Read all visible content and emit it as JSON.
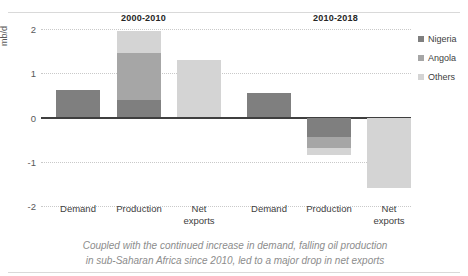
{
  "chart_data": {
    "type": "bar",
    "title": "",
    "xlabel": "",
    "ylabel": "mb/d",
    "ylim": [
      -2,
      2
    ],
    "yticks": [
      "2",
      "1",
      "0",
      "-1",
      "-2"
    ],
    "grid": true,
    "legend_position": "right",
    "stacked": true,
    "groups": [
      {
        "label": "2000-2010",
        "categories": [
          "Demand",
          "Net\nexports"
        ],
        "bars": [
          {
            "category": "Demand",
            "total": 0.62,
            "segments": [
              {
                "name": "Nigeria",
                "value": 0.62
              }
            ]
          },
          {
            "category": "Production",
            "total": 1.95,
            "segments": [
              {
                "name": "Nigeria",
                "value": 0.4
              },
              {
                "name": "Angola",
                "value": 1.05
              },
              {
                "name": "Others",
                "value": 0.5
              }
            ]
          },
          {
            "category": "Net exports",
            "total": 1.3,
            "segments": [
              {
                "name": "Others",
                "value": 1.3
              }
            ]
          }
        ]
      },
      {
        "label": "2010-2018",
        "categories": [
          "Demand",
          "Production",
          "Net exports"
        ],
        "bars": [
          {
            "category": "Demand",
            "total": 0.56,
            "segments": [
              {
                "name": "Nigeria",
                "value": 0.56
              }
            ]
          },
          {
            "category": "Production",
            "total": -0.85,
            "segments": [
              {
                "name": "Nigeria",
                "value": -0.45
              },
              {
                "name": "Angola",
                "value": -0.25
              },
              {
                "name": "Others",
                "value": -0.15
              }
            ]
          },
          {
            "category": "Net exports",
            "total": -1.6,
            "segments": [
              {
                "name": "Others",
                "value": -1.6
              }
            ]
          }
        ]
      }
    ],
    "legend": [
      {
        "label": "Nigeria",
        "color": "#7f7f7f"
      },
      {
        "label": "Angola",
        "color": "#a6a6a6"
      },
      {
        "label": "Others",
        "color": "#d4d4d4"
      }
    ]
  },
  "xlabels": [
    {
      "line1": "Demand",
      "line2": ""
    },
    {
      "line1": "Production",
      "line2": ""
    },
    {
      "line1": "Net",
      "line2": "exports"
    },
    {
      "line1": "Demand",
      "line2": ""
    },
    {
      "line1": "Production",
      "line2": ""
    },
    {
      "line1": "Net",
      "line2": "exports"
    }
  ],
  "caption": {
    "line1": "Coupled with the continued increase in demand, falling oil production",
    "line2": "in sub-Saharan Africa since 2010, led to a major drop in net exports"
  }
}
